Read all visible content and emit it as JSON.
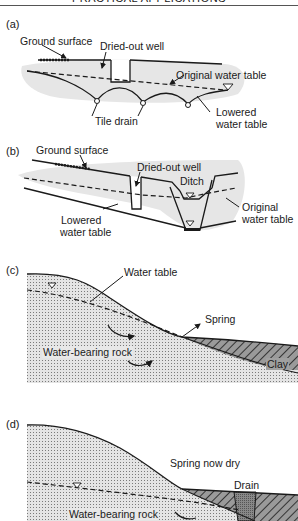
{
  "header": {
    "title": "PRACTICAL APPLICATIONS"
  },
  "panels": {
    "a": {
      "id": "(a)",
      "labels": {
        "ground_surface": "Ground surface",
        "dried_out_well": "Dried-out well",
        "original_water_table": "Original water table",
        "tile_drain": "Tile drain",
        "lowered_water_table_1": "Lowered",
        "lowered_water_table_2": "water table"
      }
    },
    "b": {
      "id": "(b)",
      "labels": {
        "ground_surface": "Ground surface",
        "dried_out_well": "Dried-out well",
        "ditch": "Ditch",
        "original_water_table_1": "Original",
        "original_water_table_2": "water table",
        "lowered_water_table_1": "Lowered",
        "lowered_water_table_2": "water table"
      }
    },
    "c": {
      "id": "(c)",
      "labels": {
        "water_table": "Water table",
        "spring": "Spring",
        "water_bearing_rock": "Water-bearing rock",
        "clay": "Clay"
      }
    },
    "d": {
      "id": "(d)",
      "labels": {
        "spring_now_dry": "Spring now dry",
        "drain": "Drain",
        "water_bearing_rock": "Water-bearing rock"
      }
    }
  },
  "colors": {
    "soil_fill": "#e6e6e6",
    "rock_fill": "#e4e4e4",
    "clay_fill": "#9a9a9a",
    "line": "#1a1a1a"
  }
}
